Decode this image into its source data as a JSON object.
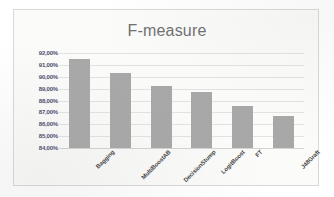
{
  "chart_data": {
    "type": "bar",
    "title": "F-measure",
    "xlabel": "",
    "ylabel": "",
    "categories": [
      "Bagging",
      "MultiBoostAB",
      "DecisionStump",
      "LogitBoost",
      "FT",
      "J48Graft"
    ],
    "values": [
      91.5,
      90.35,
      89.25,
      88.7,
      87.5,
      86.7
    ],
    "value_labels": [
      "91,50%",
      "90,35%",
      "89,25%",
      "88,70%",
      "87,50%",
      "86,70%"
    ],
    "ylim": [
      84.0,
      92.0
    ],
    "ytick_values": [
      92.0,
      91.0,
      90.0,
      89.0,
      88.0,
      87.0,
      86.0,
      85.0,
      84.0
    ],
    "ytick_labels": [
      "92,00%",
      "91,00%",
      "90,00%",
      "89,00%",
      "88,00%",
      "87,00%",
      "86,00%",
      "85,00%",
      "84,00%"
    ],
    "grid": true,
    "legend": false,
    "legend_position": "none",
    "series": [
      {
        "name": "F-measure",
        "values": [
          91.5,
          90.35,
          89.25,
          88.7,
          87.5,
          86.7
        ]
      }
    ]
  },
  "colors": {
    "bar_fill": "#a8a8a8",
    "gridline": "#e3e3e1",
    "title_text": "#6f6f6f",
    "ytick_text": "#4b4b6a",
    "xtick_text": "#3f3f3f",
    "plot_background": "#fcfcfb",
    "frame_border": "#d8d8d6",
    "page_background": "#ffffff"
  }
}
